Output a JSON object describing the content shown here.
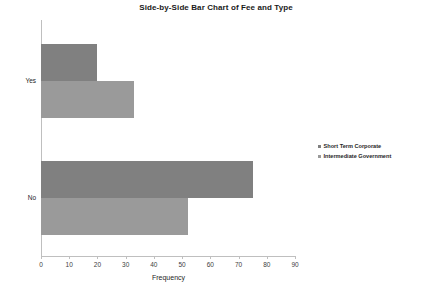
{
  "chart_data": {
    "type": "bar",
    "orientation": "horizontal",
    "title": "Side-by-Side Bar Chart of Fee and Type",
    "xlabel": "Frequency",
    "ylabel": "",
    "categories": [
      "Yes",
      "No"
    ],
    "series": [
      {
        "name": "Short Term Corporate",
        "color": "#808080",
        "values": [
          20,
          75
        ]
      },
      {
        "name": "Intermediate Government",
        "color": "#9a9a9a",
        "values": [
          33,
          52
        ]
      }
    ],
    "xlim": [
      0,
      90
    ],
    "xticks": [
      0,
      10,
      20,
      30,
      40,
      50,
      60,
      70,
      80,
      90
    ],
    "xtick_labels": [
      "0",
      "10",
      "20",
      "30",
      "40",
      "50",
      "60",
      "70",
      "80",
      "90"
    ],
    "grid": false,
    "legend_position": "right"
  },
  "legend": {
    "entries": [
      {
        "label": "Short Term Corporate"
      },
      {
        "label": "Intermediate Government"
      }
    ]
  }
}
